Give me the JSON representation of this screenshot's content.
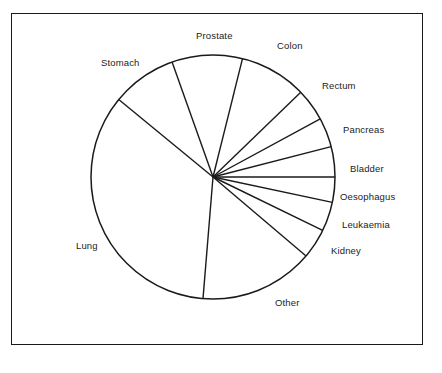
{
  "figure": {
    "background_color": "#ffffff",
    "border_color": "#1a1a1a",
    "line_color": "#1a1a1a"
  },
  "chart_data": {
    "type": "pie",
    "title": "",
    "subtitle": "",
    "xlabel": "",
    "ylabel": "",
    "grid": false,
    "legend_position": "outside-labels",
    "labels": [
      "Prostate",
      "Colon",
      "Rectum",
      "Pancreas",
      "Bladder",
      "Oesophagus",
      "Leukaemia",
      "Kidney",
      "Other",
      "Lung",
      "Stomach"
    ],
    "values": [
      9.3,
      9.0,
      4.3,
      4.0,
      4.0,
      3.5,
      3.8,
      4.0,
      15.3,
      28.8,
      14.0
    ],
    "units": "percent",
    "start_angle_deg": 109.6,
    "direction": "clockwise",
    "boundary_angles_deg": [
      109.6,
      76.0,
      44.0,
      28.5,
      14.4,
      0.0,
      -12.0,
      -26.0,
      -40.3,
      -94.7,
      140.6
    ],
    "geometry": {
      "center_x": 213,
      "center_y": 177,
      "radius": 122
    },
    "slices": [
      {
        "name": "Prostate",
        "value": 9.3,
        "start_deg": 109.6,
        "end_deg": 76.0
      },
      {
        "name": "Colon",
        "value": 9.0,
        "start_deg": 76.0,
        "end_deg": 44.0
      },
      {
        "name": "Rectum",
        "value": 4.3,
        "start_deg": 44.0,
        "end_deg": 28.5
      },
      {
        "name": "Pancreas",
        "value": 4.0,
        "start_deg": 28.5,
        "end_deg": 14.4
      },
      {
        "name": "Bladder",
        "value": 4.0,
        "start_deg": 14.4,
        "end_deg": 0.0
      },
      {
        "name": "Oesophagus",
        "value": 3.5,
        "start_deg": 0.0,
        "end_deg": -12.0
      },
      {
        "name": "Leukaemia",
        "value": 3.8,
        "start_deg": -12.0,
        "end_deg": -26.0
      },
      {
        "name": "Kidney",
        "value": 4.0,
        "start_deg": -26.0,
        "end_deg": -40.3
      },
      {
        "name": "Other",
        "value": 15.3,
        "start_deg": -40.3,
        "end_deg": -94.7
      },
      {
        "name": "Lung",
        "value": 28.8,
        "start_deg": -94.7,
        "end_deg": -219.4
      },
      {
        "name": "Stomach",
        "value": 14.0,
        "start_deg": 140.6,
        "end_deg": 109.6
      }
    ]
  },
  "labels": {
    "prostate": {
      "text": "Prostate",
      "x": 196,
      "y": 30
    },
    "colon": {
      "text": "Colon",
      "x": 277,
      "y": 40
    },
    "rectum": {
      "text": "Rectum",
      "x": 322,
      "y": 80
    },
    "pancreas": {
      "text": "Pancreas",
      "x": 343,
      "y": 124
    },
    "bladder": {
      "text": "Bladder",
      "x": 350,
      "y": 163
    },
    "oesophagus": {
      "text": "Oesophagus",
      "x": 340,
      "y": 191
    },
    "leukaemia": {
      "text": "Leukaemia",
      "x": 342,
      "y": 219
    },
    "kidney": {
      "text": "Kidney",
      "x": 331,
      "y": 245
    },
    "other": {
      "text": "Other",
      "x": 275,
      "y": 297
    },
    "lung": {
      "text": "Lung",
      "x": 76,
      "y": 240
    },
    "stomach": {
      "text": "Stomach",
      "x": 101,
      "y": 57
    }
  }
}
